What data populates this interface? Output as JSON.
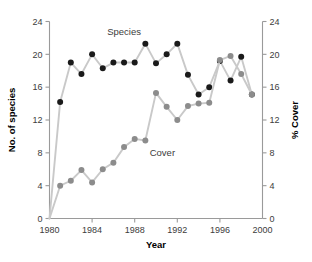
{
  "chart_data": {
    "type": "line",
    "title": "",
    "subtitle": "",
    "xlabel": "Year",
    "ylabel": "No. of species",
    "y2label": "% Cover",
    "xlim": [
      1980,
      2000
    ],
    "ylim": [
      0,
      24
    ],
    "y2lim": [
      0,
      24
    ],
    "xticks": [
      1980,
      1984,
      1988,
      1992,
      1996,
      2000
    ],
    "xticklabels": [
      "1980",
      "1984",
      "1988",
      "1992",
      "1996",
      "2000"
    ],
    "yticks": [
      0,
      4,
      8,
      12,
      16,
      20,
      24
    ],
    "yticklabels": [
      "0",
      "4",
      "8",
      "12",
      "16",
      "20",
      "24"
    ],
    "y2ticks": [
      0,
      4,
      8,
      12,
      16,
      20,
      24
    ],
    "y2ticklabels": [
      "0",
      "4",
      "8",
      "12",
      "16",
      "20",
      "24"
    ],
    "grid": false,
    "legend": "inline-annotations",
    "x": [
      1980,
      1981,
      1982,
      1983,
      1984,
      1985,
      1986,
      1987,
      1988,
      1989,
      1990,
      1991,
      1992,
      1993,
      1994,
      1995,
      1996,
      1997,
      1998,
      1999
    ],
    "series": [
      {
        "name": "Species",
        "axis": "left",
        "marker_color": "#1a1a1a",
        "line_color": "#c9c9c9",
        "values": [
          0,
          14.2,
          19.0,
          17.6,
          20.0,
          18.3,
          19.0,
          19.0,
          19.0,
          21.3,
          18.9,
          20.0,
          21.3,
          17.5,
          15.1,
          16.0,
          19.2,
          16.8,
          19.7,
          15.1
        ]
      },
      {
        "name": "Cover",
        "axis": "right",
        "marker_color": "#8c8c8c",
        "line_color": "#c9c9c9",
        "values": [
          0,
          4.0,
          4.6,
          5.9,
          4.4,
          6.0,
          6.8,
          8.7,
          9.7,
          9.5,
          15.3,
          13.6,
          12.0,
          13.7,
          14.0,
          14.1,
          19.3,
          19.8,
          17.6,
          15.1
        ]
      }
    ],
    "annotations": [
      {
        "text": "Species",
        "x": 1987.0,
        "y": 22.3,
        "axis": "left"
      },
      {
        "text": "Cover",
        "x": 1990.6,
        "y": 7.6,
        "axis": "right"
      }
    ]
  }
}
